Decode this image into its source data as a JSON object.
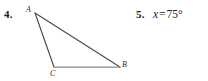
{
  "page": {
    "background_color": "#ffffff",
    "width": 208,
    "height": 81
  },
  "exercises": [
    {
      "number": "4.",
      "kind": "figure",
      "figure": {
        "type": "triangle",
        "stroke_color": "#4a4a4a",
        "base_stroke_color": "#8a8a8a",
        "vertices": [
          {
            "name": "A",
            "label": "A",
            "x": 35,
            "y": 13
          },
          {
            "name": "C",
            "label": "C",
            "x": 54,
            "y": 67
          },
          {
            "name": "B",
            "label": "B",
            "x": 120,
            "y": 67
          }
        ],
        "edges": [
          {
            "from": "A",
            "to": "B"
          },
          {
            "from": "A",
            "to": "C"
          },
          {
            "from": "C",
            "to": "B"
          }
        ]
      }
    },
    {
      "number": "5.",
      "kind": "answer",
      "answer": {
        "variable": "x",
        "equals": "=",
        "value": "75°"
      }
    }
  ]
}
